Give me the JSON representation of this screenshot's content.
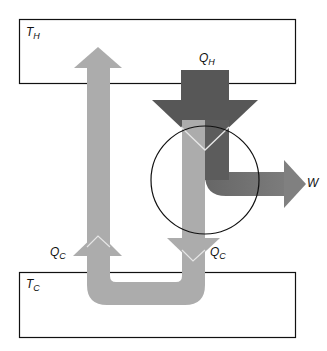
{
  "diagram": {
    "type": "heat-engine-energy-flow",
    "reservoirs": {
      "hot": {
        "label": "T",
        "subscript": "H"
      },
      "cold": {
        "label": "T",
        "subscript": "C"
      }
    },
    "flows": {
      "heat_in": {
        "label": "Q",
        "subscript": "H"
      },
      "work_out": {
        "label": "W"
      },
      "heat_out": {
        "label": "Q",
        "subscript": "C"
      },
      "heat_return": {
        "label": "Q",
        "subscript": "C"
      }
    }
  },
  "colors": {
    "background": "#ffffff",
    "outline": "#111111",
    "hot_arrow": "#575757",
    "mid_arrow": "#7b7b7b",
    "cold_arrow": "#acacac",
    "highlight": "#e6e6e6"
  }
}
